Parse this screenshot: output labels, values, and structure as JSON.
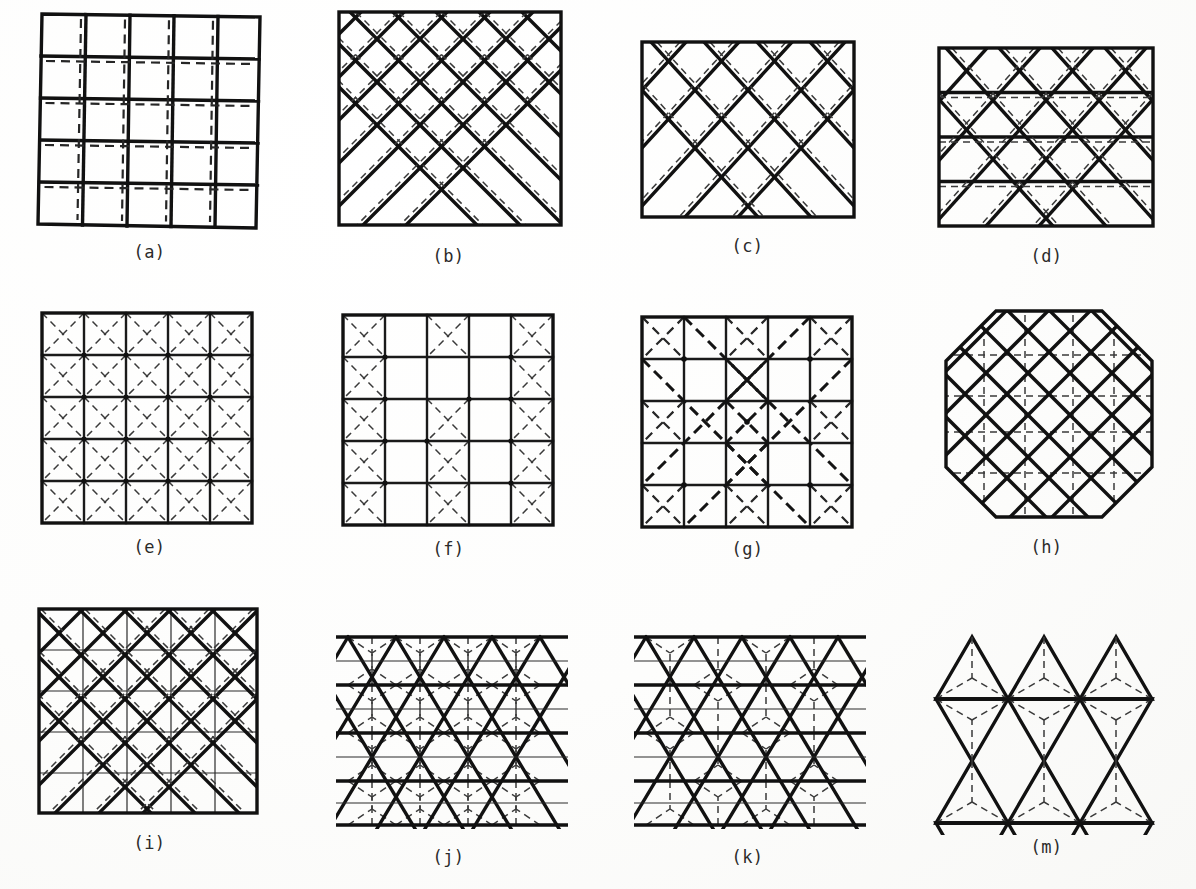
{
  "figure": {
    "background_color": "#ffffff",
    "ink_color": "#111111",
    "columns": 4,
    "rows": 3,
    "panel_count": 12
  },
  "panels": [
    {
      "id": "a",
      "caption": "(a)",
      "pattern": "orthogonal-square-grid",
      "description": "5 by 5 square grid of solid members with dashed secondary members",
      "divisions": 5,
      "boundary": "square",
      "has_diagonals": false,
      "width": 225,
      "height": 218
    },
    {
      "id": "b",
      "caption": "(b)",
      "pattern": "diagonal-square-grid",
      "description": "45 degree rotated square lattice inside a square boundary",
      "divisions": 5,
      "boundary": "square",
      "has_diagonals": true,
      "width": 222,
      "height": 213
    },
    {
      "id": "c",
      "caption": "(c)",
      "pattern": "rhombic-diamond-lattice",
      "description": "Zigzag diagonals forming diamonds, no interior horizontals",
      "divisions": 4,
      "boundary": "rectangle",
      "has_diagonals": true,
      "width": 212,
      "height": 180
    },
    {
      "id": "d",
      "caption": "(d)",
      "pattern": "triangular-lattice",
      "description": "Equilateral triangle lattice with horizontal chords",
      "divisions": 4,
      "boundary": "rectangle",
      "has_diagonals": true,
      "width": 212,
      "height": 180
    },
    {
      "id": "e",
      "caption": "(e)",
      "pattern": "square-grid-full-x-bracing",
      "description": "Square grid with dashed diagonal cross bracing in every cell",
      "divisions": 5,
      "boundary": "square",
      "has_diagonals": true,
      "width": 218,
      "height": 212
    },
    {
      "id": "f",
      "caption": "(f)",
      "pattern": "square-grid-checker-bracing",
      "description": "Square grid with X bracing on alternating checkerboard cells",
      "divisions": 5,
      "boundary": "square",
      "has_diagonals": true,
      "width": 212,
      "height": 207
    },
    {
      "id": "g",
      "caption": "(g)",
      "pattern": "square-grid-diagonal-band-bracing",
      "description": "Square grid braced along diagonal bands and corners",
      "divisions": 5,
      "boundary": "square",
      "has_diagonals": true,
      "width": 212,
      "height": 207
    },
    {
      "id": "h",
      "caption": "(h)",
      "pattern": "octagonal-diagonal-lattice",
      "description": "Octagonal boundary, heavy diagonal lattice over dashed orthogonal grid",
      "divisions": 5,
      "boundary": "octagon",
      "has_diagonals": true,
      "width": 216,
      "height": 212
    },
    {
      "id": "i",
      "caption": "(i)",
      "pattern": "diagonal-lattice-with-orthogonal-grid",
      "description": "Heavy 45 degree lattice superposed on a thin orthogonal grid",
      "divisions": 5,
      "boundary": "square",
      "has_diagonals": true,
      "width": 220,
      "height": 210
    },
    {
      "id": "j",
      "caption": "(j)",
      "pattern": "triangular-lattice-with-centroid-bracing",
      "description": "Triangular lattice, every triangle subdivided by dashed Y members to its centroid",
      "divisions": 5,
      "boundary": "zigzag-edge",
      "has_diagonals": true,
      "width": 224,
      "height": 200
    },
    {
      "id": "k",
      "caption": "(k)",
      "pattern": "triangular-lattice-with-alternate-centroid-bracing",
      "description": "Triangular lattice with centroid Y bracing on alternate triangles",
      "divisions": 5,
      "boundary": "zigzag-edge",
      "has_diagonals": true,
      "width": 222,
      "height": 200
    },
    {
      "id": "m",
      "caption": "(m)",
      "pattern": "kagome-star-lattice",
      "description": "Kagome / star lattice of triangles and hexagons with Y bracing inside each triangle",
      "divisions": 3,
      "boundary": "open",
      "has_diagonals": true,
      "width": 218,
      "height": 200
    }
  ]
}
